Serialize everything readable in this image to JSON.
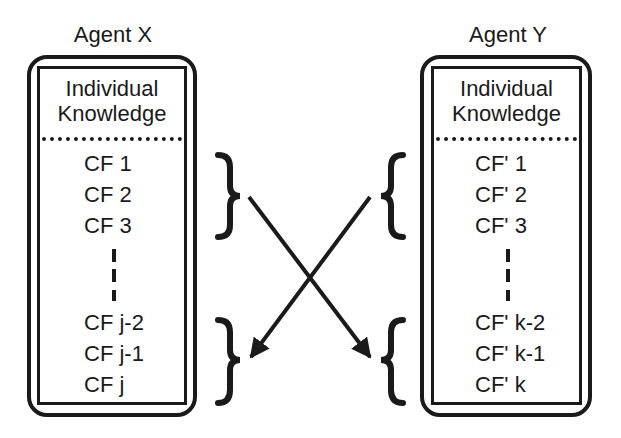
{
  "diagram": {
    "agents": [
      {
        "title": "Agent X",
        "section_label_line1": "Individual",
        "section_label_line2": "Knowledge",
        "top_items": [
          "CF 1",
          "CF 2",
          "CF 3"
        ],
        "bottom_items": [
          "CF j-2",
          "CF j-1",
          "CF j"
        ]
      },
      {
        "title": "Agent Y",
        "section_label_line1": "Individual",
        "section_label_line2": "Knowledge",
        "top_items": [
          "CF' 1",
          "CF' 2",
          "CF' 3"
        ],
        "bottom_items": [
          "CF' k-2",
          "CF' k-1",
          "CF' k"
        ]
      }
    ],
    "arrows": [
      {
        "from": "Agent X top group",
        "to": "Agent Y bottom group"
      },
      {
        "from": "Agent Y top group",
        "to": "Agent X bottom group"
      }
    ],
    "colors": {
      "ink": "#1a1a1a",
      "background": "#ffffff"
    }
  }
}
